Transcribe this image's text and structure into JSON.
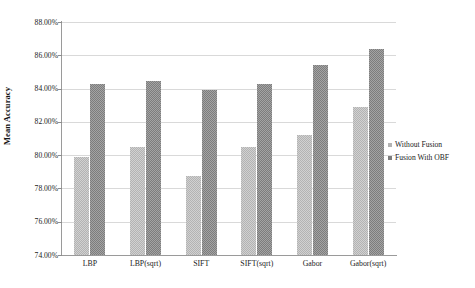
{
  "chart_data": {
    "type": "bar",
    "title": "",
    "subtitle": "",
    "xlabel": "",
    "ylabel": "Mean Accuracy",
    "categories": [
      "LBP",
      "LBP(sqrt)",
      "SIFT",
      "SIFT(sqrt)",
      "Gabor",
      "Gabor(sqrt)"
    ],
    "series": [
      {
        "name": "Without Fusion",
        "color": "#b3b3b3",
        "values": [
          79.9,
          80.5,
          78.75,
          80.5,
          81.2,
          82.9
        ]
      },
      {
        "name": "Fusion With OBF",
        "color": "#7d7d7d",
        "values": [
          84.3,
          84.45,
          83.9,
          84.25,
          85.4,
          86.4
        ]
      }
    ],
    "ylim": [
      74.0,
      88.0
    ],
    "ytick_step": 2.0,
    "ytick_labels": [
      "88.00%",
      "86.00%",
      "84.00%",
      "82.00%",
      "80.00%",
      "78.00%",
      "76.00%",
      "74.00%"
    ],
    "ytick_values": [
      88.0,
      86.0,
      84.0,
      82.0,
      80.0,
      78.0,
      76.0,
      74.0
    ],
    "value_suffix": "%",
    "grid": true,
    "grid_color": "#d9d9d9",
    "axis_color": "#9a9a9a",
    "legend_position": "right",
    "background_color": "#ffffff"
  }
}
